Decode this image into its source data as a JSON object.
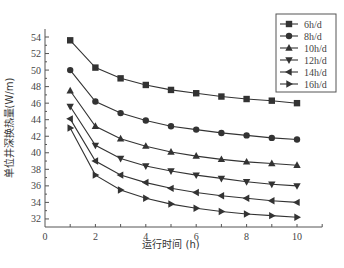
{
  "chart_data": {
    "type": "line",
    "title": "",
    "xlabel": "运行时间 (h)",
    "ylabel": "单位井深换热量(W/m)",
    "xlim": [
      0,
      11
    ],
    "ylim": [
      31,
      55
    ],
    "xticks": [
      0,
      2,
      4,
      6,
      8,
      10
    ],
    "yticks": [
      32,
      34,
      36,
      38,
      40,
      42,
      44,
      46,
      48,
      50,
      52,
      54
    ],
    "grid": false,
    "legend_position": "upper right",
    "x": [
      1,
      2,
      3,
      4,
      5,
      6,
      7,
      8,
      9,
      10
    ],
    "series": [
      {
        "name": "6h/d",
        "marker": "square",
        "values": [
          53.6,
          50.3,
          49.0,
          48.2,
          47.6,
          47.2,
          46.8,
          46.5,
          46.3,
          46.0
        ]
      },
      {
        "name": "8h/d",
        "marker": "circle",
        "values": [
          50.0,
          46.2,
          44.8,
          43.9,
          43.2,
          42.8,
          42.4,
          42.1,
          41.8,
          41.6
        ]
      },
      {
        "name": "10h/d",
        "marker": "triangle-up",
        "values": [
          47.5,
          43.2,
          41.7,
          40.8,
          40.1,
          39.6,
          39.2,
          38.9,
          38.7,
          38.5
        ]
      },
      {
        "name": "12h/d",
        "marker": "triangle-down",
        "values": [
          45.6,
          40.9,
          39.3,
          38.4,
          37.8,
          37.3,
          36.9,
          36.5,
          36.2,
          36.0
        ]
      },
      {
        "name": "14h/d",
        "marker": "triangle-left",
        "values": [
          44.1,
          39.0,
          37.3,
          36.4,
          35.7,
          35.2,
          34.8,
          34.5,
          34.2,
          34.0
        ]
      },
      {
        "name": "16h/d",
        "marker": "triangle-right",
        "values": [
          43.0,
          37.3,
          35.5,
          34.5,
          33.8,
          33.3,
          32.9,
          32.6,
          32.4,
          32.2
        ]
      }
    ],
    "colors": {
      "line": "#333333",
      "axis": "#555555"
    }
  }
}
